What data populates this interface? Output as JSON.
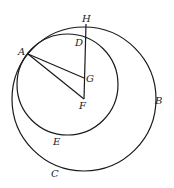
{
  "diagram": {
    "colors": {
      "stroke": "#1a1a1a",
      "background": "#ffffff",
      "label": "#222222"
    },
    "circles": [
      {
        "name": "outer-circle",
        "cx": 84,
        "cy": 99,
        "r": 72,
        "points_on": [
          "A",
          "H",
          "B",
          "C"
        ]
      },
      {
        "name": "inner-circle",
        "cx": 67.5,
        "cy": 84.5,
        "r": 50.5,
        "points_on": [
          "A",
          "D",
          "E"
        ]
      }
    ],
    "segments": [
      {
        "name": "segment-AG",
        "from": "A",
        "to": "G"
      },
      {
        "name": "segment-AF",
        "from": "A",
        "to": "F"
      },
      {
        "name": "segment-HF",
        "from": "H",
        "to": "F"
      }
    ],
    "points": {
      "A": {
        "x": 28,
        "y": 54
      },
      "H": {
        "x": 86,
        "y": 25
      },
      "D": {
        "x": 86,
        "y": 37
      },
      "G": {
        "x": 84,
        "y": 78
      },
      "F": {
        "x": 84,
        "y": 99
      }
    },
    "labels": [
      {
        "text": "H",
        "x": 82,
        "y": 22
      },
      {
        "text": "D",
        "x": 75,
        "y": 46
      },
      {
        "text": "A",
        "x": 18,
        "y": 55
      },
      {
        "text": "G",
        "x": 86,
        "y": 82
      },
      {
        "text": "F",
        "x": 79,
        "y": 109
      },
      {
        "text": "B",
        "x": 155,
        "y": 104
      },
      {
        "text": "E",
        "x": 53,
        "y": 145
      },
      {
        "text": "C",
        "x": 51,
        "y": 177
      }
    ]
  }
}
